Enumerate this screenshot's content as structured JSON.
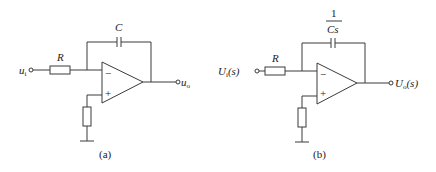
{
  "diagram": {
    "type": "op-amp integrator circuits",
    "colors": {
      "line": "#3a3a3a",
      "text": "#222222",
      "background": "#ffffff"
    },
    "circuit_a": {
      "caption": "(a)",
      "input_label": "u",
      "input_sub": "i",
      "output_label": "u",
      "output_sub": "o",
      "resistor_label": "R",
      "capacitor_label": "C",
      "inverting_sign": "−",
      "noninverting_sign": "+"
    },
    "circuit_b": {
      "caption": "(b)",
      "input_label": "U",
      "input_sub": "i",
      "input_arg": "(s)",
      "output_label": "U",
      "output_sub": "o",
      "output_arg": "(s)",
      "resistor_label": "R",
      "capacitor_num": "1",
      "capacitor_den": "Cs",
      "inverting_sign": "−",
      "noninverting_sign": "+"
    }
  }
}
